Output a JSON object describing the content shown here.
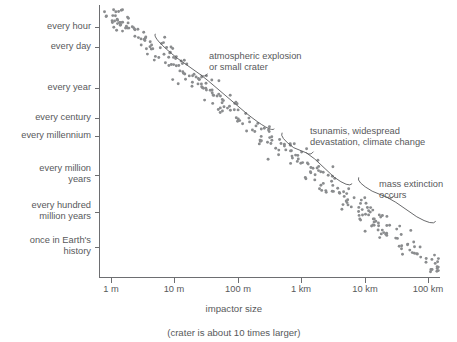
{
  "chart_data": {
    "type": "scatter",
    "title": "",
    "xlabel": "impactor size",
    "xsublabel": "(crater is about 10 times larger)",
    "ylabel": "",
    "grid": false,
    "legend": null,
    "x_axis": {
      "scale": "log",
      "unit": "impactor diameter",
      "ticks": [
        {
          "label": "1 m",
          "value": 1,
          "px": 111
        },
        {
          "label": "10 m",
          "value": 10,
          "px": 174
        },
        {
          "label": "100 m",
          "value": 100,
          "px": 238
        },
        {
          "label": "1 km",
          "value": 1000,
          "px": 301
        },
        {
          "label": "10 km",
          "value": 10000,
          "px": 365
        },
        {
          "label": "100 km",
          "value": 100000,
          "px": 428
        }
      ]
    },
    "y_axis": {
      "scale": "log-time",
      "direction": "frequent at top, rare at bottom",
      "ticks": [
        {
          "label": "every hour",
          "px": 27
        },
        {
          "label": "every day",
          "px": 47
        },
        {
          "label": "every year",
          "px": 88
        },
        {
          "label": "every century",
          "px": 118
        },
        {
          "label": "every millennium",
          "px": 136
        },
        {
          "label": "every million\nyears",
          "px": 175
        },
        {
          "label": "every hundred\nmillion years",
          "px": 212
        },
        {
          "label": "once in Earth's\nhistory",
          "px": 247
        }
      ]
    },
    "annotations": [
      {
        "id": "atmospheric-explosion",
        "text": "atmospheric explosion\nor small crater",
        "text_px": {
          "x": 209,
          "y": 51
        },
        "brace": {
          "x1": 152,
          "y1": 38,
          "x2": 271,
          "y2": 133,
          "tip_x": 205,
          "tip_y": 77
        }
      },
      {
        "id": "tsunamis-devastation",
        "text": "tsunamis, widespread\ndevastation, climate change",
        "text_px": {
          "x": 310,
          "y": 126
        },
        "brace": {
          "x1": 279,
          "y1": 137,
          "x2": 349,
          "y2": 188,
          "tip_x": 311,
          "tip_y": 155
        }
      },
      {
        "id": "mass-extinction",
        "text": "mass extinction\noccurs",
        "text_px": {
          "x": 379,
          "y": 179
        },
        "brace": {
          "x1": 356,
          "y1": 182,
          "x2": 433,
          "y2": 226,
          "tip_x": 392,
          "tip_y": 199
        }
      }
    ],
    "series": [
      {
        "name": "impact events",
        "marker": "circle",
        "color": "#8a8c8e",
        "n_points": 312,
        "trend": "linear in log-log space, negative slope, with vertical scatter",
        "band": {
          "x_start_px": 104,
          "x_end_px": 440,
          "y_start_px": 8,
          "y_end_px": 272,
          "spread_px": 26
        }
      }
    ]
  },
  "axes": {
    "y_axis_x_px": 99,
    "x_axis_y_px": 277,
    "plot_top_px": 5,
    "plot_right_px": 440
  },
  "colors": {
    "background": "#ffffff",
    "axis": "#6d6e71",
    "text": "#58595b",
    "point": "#8a8c8e",
    "brace": "#58595b"
  }
}
